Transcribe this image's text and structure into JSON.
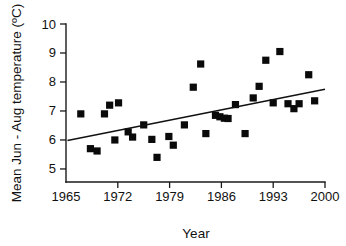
{
  "chart_data": {
    "type": "scatter",
    "title": "",
    "xlabel": "Year",
    "ylabel": "Mean Jun - Aug temperature (ºC)",
    "xlim": [
      1965,
      2000
    ],
    "ylim": [
      4.55,
      10
    ],
    "grid": false,
    "legend": null,
    "xticks": [
      1965,
      1972,
      1979,
      1986,
      1993,
      2000
    ],
    "xtick_labels": [
      "1965",
      "1972",
      "1979",
      "1986",
      "1993",
      "2000"
    ],
    "yticks": [
      5,
      6,
      7,
      8,
      9,
      10
    ],
    "ytick_labels": [
      "5",
      "6",
      "7",
      "8",
      "9",
      "10"
    ],
    "marker_style": "filled-square",
    "marker_color": "#0a0a0a",
    "points": [
      {
        "x": 1967.0,
        "y": 6.9
      },
      {
        "x": 1968.3,
        "y": 5.7
      },
      {
        "x": 1969.2,
        "y": 5.62
      },
      {
        "x": 1970.2,
        "y": 6.9
      },
      {
        "x": 1970.9,
        "y": 7.2
      },
      {
        "x": 1972.1,
        "y": 7.28
      },
      {
        "x": 1971.6,
        "y": 6.0
      },
      {
        "x": 1973.4,
        "y": 6.28
      },
      {
        "x": 1974.0,
        "y": 6.1
      },
      {
        "x": 1975.5,
        "y": 6.52
      },
      {
        "x": 1976.6,
        "y": 6.02
      },
      {
        "x": 1977.3,
        "y": 5.4
      },
      {
        "x": 1978.9,
        "y": 6.12
      },
      {
        "x": 1979.5,
        "y": 5.82
      },
      {
        "x": 1981.0,
        "y": 6.52
      },
      {
        "x": 1982.2,
        "y": 7.82
      },
      {
        "x": 1983.2,
        "y": 8.62
      },
      {
        "x": 1983.9,
        "y": 6.22
      },
      {
        "x": 1985.2,
        "y": 6.85
      },
      {
        "x": 1985.8,
        "y": 6.8
      },
      {
        "x": 1986.4,
        "y": 6.75
      },
      {
        "x": 1986.9,
        "y": 6.74
      },
      {
        "x": 1987.9,
        "y": 7.22
      },
      {
        "x": 1989.2,
        "y": 6.22
      },
      {
        "x": 1990.3,
        "y": 7.45
      },
      {
        "x": 1991.1,
        "y": 7.85
      },
      {
        "x": 1992.0,
        "y": 8.75
      },
      {
        "x": 1993.0,
        "y": 7.28
      },
      {
        "x": 1993.9,
        "y": 9.05
      },
      {
        "x": 1995.0,
        "y": 7.25
      },
      {
        "x": 1995.8,
        "y": 7.08
      },
      {
        "x": 1996.5,
        "y": 7.25
      },
      {
        "x": 1997.8,
        "y": 8.25
      },
      {
        "x": 1998.6,
        "y": 7.35
      }
    ],
    "trendline": {
      "type": "linear",
      "x_start": 1965.2,
      "y_start": 5.98,
      "x_end": 2000.0,
      "y_end": 7.75
    }
  }
}
